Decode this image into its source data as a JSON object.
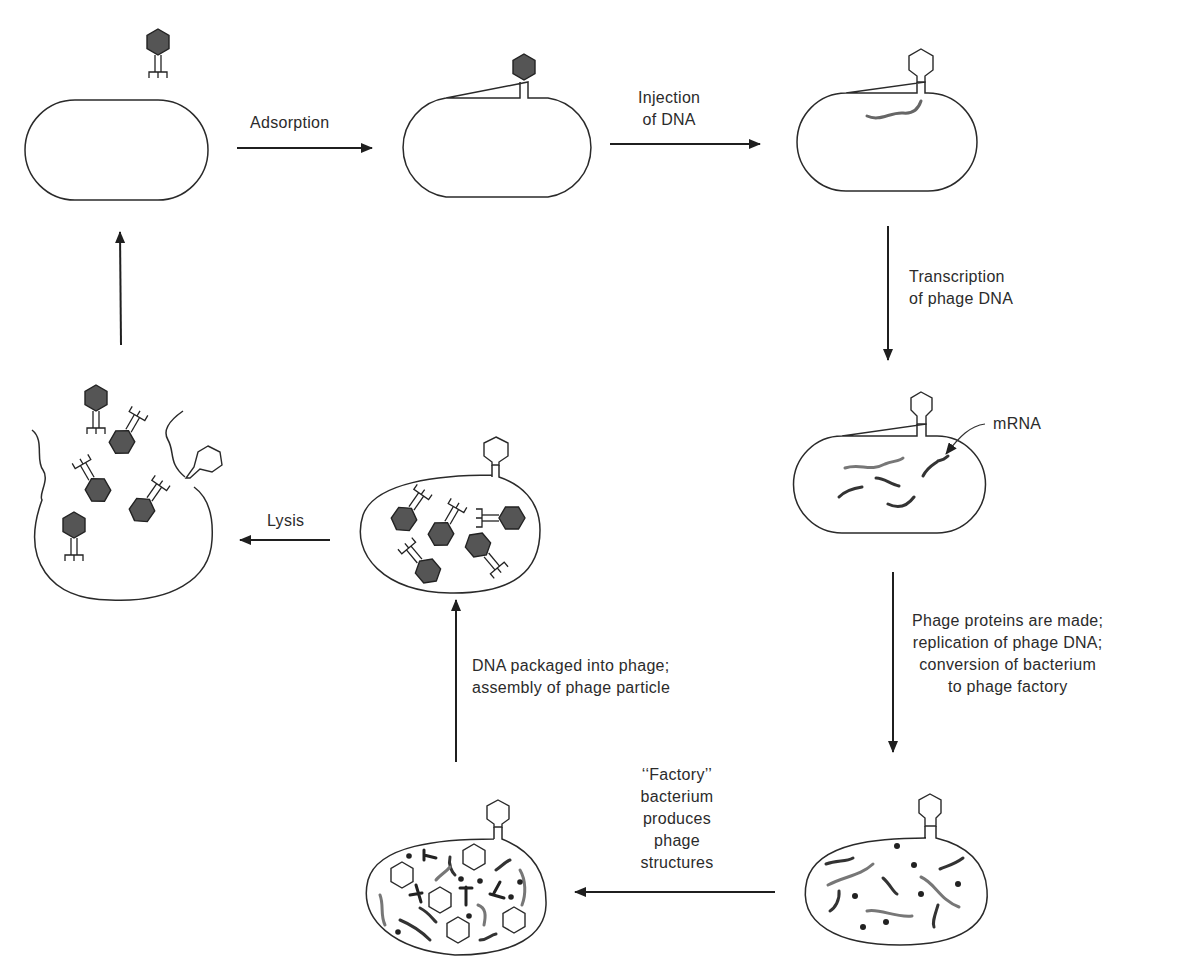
{
  "diagram": {
    "type": "lytic-cycle",
    "colors": {
      "outline": "#2a2a2a",
      "phage_fill": "#555555",
      "background": "#ffffff"
    },
    "stages": [
      {
        "id": "free-phage-approach",
        "description": "Phage approaching bacterium"
      },
      {
        "id": "attached-phage",
        "description": "Phage attached to bacterium"
      },
      {
        "id": "dna-injected",
        "description": "Empty phage coat with injected DNA inside bacterium"
      },
      {
        "id": "mrna-transcribed",
        "description": "Bacterium containing mRNA strands"
      },
      {
        "id": "replication",
        "description": "Bacterium with replicated DNA and proteins"
      },
      {
        "id": "factory",
        "description": "Factory bacterium with phage heads, tails and DNA"
      },
      {
        "id": "assembled",
        "description": "Bacterium full of assembled phage particles"
      },
      {
        "id": "lysed",
        "description": "Lysed bacterium releasing phages"
      }
    ],
    "steps": {
      "adsorption": "Adsorption",
      "injection": [
        "Injection",
        "of DNA"
      ],
      "transcription": [
        "Transcription",
        "of phage DNA"
      ],
      "mrna_label": "mRNA",
      "protein": [
        "Phage proteins are made;",
        "replication of phage DNA;",
        "conversion of bacterium",
        "to phage factory"
      ],
      "factory": [
        "‘‘Factory’’",
        "bacterium",
        "produces",
        "phage",
        "structures"
      ],
      "packaging": [
        "DNA packaged into phage;",
        "assembly of phage particle"
      ],
      "lysis": "Lysis"
    }
  }
}
